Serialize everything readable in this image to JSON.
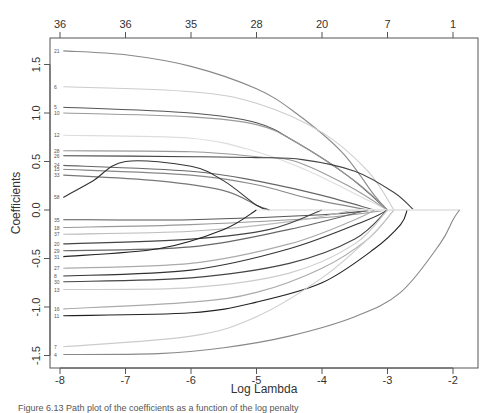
{
  "chart_data": {
    "type": "line",
    "title": "",
    "xlabel": "Log Lambda",
    "ylabel": "Coefficients",
    "xlim": [
      -8.15,
      -1.6
    ],
    "ylim": [
      -1.57,
      1.8
    ],
    "grid": false,
    "legend": "none",
    "x_ticks": [
      -8,
      -7,
      -6,
      -5,
      -4,
      -3,
      -2
    ],
    "y_ticks": [
      -1.5,
      -1.0,
      -0.5,
      0.0,
      0.5,
      1.0,
      1.5
    ],
    "y_tick_labels": [
      "-1.5",
      "-1.0",
      "-0.5",
      "0.0",
      "0.5",
      "1.0",
      "1.5"
    ],
    "top_axis": {
      "label": "number of nonzero coefficients",
      "positions": [
        -8,
        -7,
        -6,
        -5,
        -4,
        -3,
        -2
      ],
      "labels": [
        "36",
        "36",
        "35",
        "28",
        "20",
        "7",
        "1"
      ]
    },
    "series": [
      {
        "name": "21",
        "color": "#888888",
        "points": [
          [
            -7.95,
            1.64
          ],
          [
            -7,
            1.6
          ],
          [
            -6,
            1.48
          ],
          [
            -5,
            1.25
          ],
          [
            -4.4,
            1.0
          ],
          [
            -3.7,
            0.6
          ],
          [
            -3.2,
            0.15
          ],
          [
            -3.0,
            0.0
          ]
        ]
      },
      {
        "name": "6",
        "color": "#cccccc",
        "points": [
          [
            -7.95,
            1.27
          ],
          [
            -6,
            1.22
          ],
          [
            -5,
            1.1
          ],
          [
            -4,
            0.8
          ],
          [
            -3.3,
            0.4
          ],
          [
            -2.9,
            0.0
          ]
        ]
      },
      {
        "name": "5",
        "color": "#555555",
        "points": [
          [
            -7.95,
            1.06
          ],
          [
            -6,
            1.0
          ],
          [
            -5,
            0.9
          ],
          [
            -4.4,
            0.7
          ],
          [
            -3.6,
            0.35
          ],
          [
            -3.0,
            0.0
          ]
        ]
      },
      {
        "name": "10",
        "color": "#999999",
        "points": [
          [
            -7.95,
            1.0
          ],
          [
            -6,
            0.96
          ],
          [
            -5,
            0.88
          ],
          [
            -4.4,
            0.7
          ],
          [
            -3.5,
            0.3
          ],
          [
            -3.0,
            0.0
          ]
        ]
      },
      {
        "name": "12",
        "color": "#dddddd",
        "points": [
          [
            -7.95,
            0.77
          ],
          [
            -6,
            0.74
          ],
          [
            -5,
            0.6
          ],
          [
            -4.2,
            0.4
          ],
          [
            -3.3,
            0.1
          ],
          [
            -3.0,
            0.0
          ]
        ]
      },
      {
        "name": "28",
        "color": "#999999",
        "points": [
          [
            -7.95,
            0.61
          ],
          [
            -6,
            0.6
          ],
          [
            -5,
            0.55
          ],
          [
            -4.4,
            0.5
          ],
          [
            -3.6,
            0.25
          ],
          [
            -3.0,
            0.0
          ]
        ]
      },
      {
        "name": "26",
        "color": "#444444",
        "points": [
          [
            -7.95,
            0.56
          ],
          [
            -6,
            0.55
          ],
          [
            -5,
            0.54
          ],
          [
            -4.3,
            0.52
          ],
          [
            -3.5,
            0.4
          ],
          [
            -2.9,
            0.18
          ],
          [
            -2.6,
            0.0
          ]
        ]
      },
      {
        "name": "24",
        "color": "#666666",
        "points": [
          [
            -7.95,
            0.46
          ],
          [
            -6,
            0.4
          ],
          [
            -5,
            0.3
          ],
          [
            -4,
            0.15
          ],
          [
            -3.2,
            0.0
          ]
        ]
      },
      {
        "name": "15",
        "color": "#888888",
        "points": [
          [
            -7.95,
            0.42
          ],
          [
            -6,
            0.36
          ],
          [
            -5,
            0.26
          ],
          [
            -4.2,
            0.12
          ],
          [
            -3.3,
            0.0
          ]
        ]
      },
      {
        "name": "33",
        "color": "#777777",
        "points": [
          [
            -7.95,
            0.36
          ],
          [
            -6.5,
            0.3
          ],
          [
            -5.5,
            0.2
          ],
          [
            -5,
            0.05
          ],
          [
            -4.8,
            0.0
          ]
        ]
      },
      {
        "name": "58",
        "color": "#333333",
        "points": [
          [
            -7.95,
            0.13
          ],
          [
            -7.5,
            0.3
          ],
          [
            -7,
            0.5
          ],
          [
            -6,
            0.45
          ],
          [
            -5.5,
            0.3
          ],
          [
            -5,
            0.05
          ],
          [
            -4.8,
            0.0
          ]
        ]
      },
      {
        "name": "35",
        "color": "#555555",
        "points": [
          [
            -7.95,
            -0.1
          ],
          [
            -6,
            -0.1
          ],
          [
            -4,
            -0.05
          ],
          [
            -3.2,
            0.0
          ]
        ]
      },
      {
        "name": "18",
        "color": "#999999",
        "points": [
          [
            -7.95,
            -0.18
          ],
          [
            -6,
            -0.15
          ],
          [
            -4,
            -0.08
          ],
          [
            -3.0,
            0.0
          ]
        ]
      },
      {
        "name": "37",
        "color": "#bbbbbb",
        "points": [
          [
            -7.95,
            -0.25
          ],
          [
            -6,
            -0.22
          ],
          [
            -4.5,
            -0.12
          ],
          [
            -3.5,
            0.0
          ]
        ]
      },
      {
        "name": "20",
        "color": "#444444",
        "points": [
          [
            -7.95,
            -0.35
          ],
          [
            -6,
            -0.3
          ],
          [
            -4.8,
            -0.2
          ],
          [
            -4.0,
            0.0
          ]
        ]
      },
      {
        "name": "29",
        "color": "#666666",
        "points": [
          [
            -7.95,
            -0.42
          ],
          [
            -6,
            -0.38
          ],
          [
            -4.5,
            -0.2
          ],
          [
            -3.3,
            0.0
          ]
        ]
      },
      {
        "name": "31",
        "color": "#222222",
        "points": [
          [
            -7.95,
            -0.48
          ],
          [
            -6.5,
            -0.4
          ],
          [
            -5.5,
            -0.2
          ],
          [
            -5,
            0.0
          ]
        ]
      },
      {
        "name": "27",
        "color": "#aaaaaa",
        "points": [
          [
            -7.95,
            -0.6
          ],
          [
            -6,
            -0.55
          ],
          [
            -4.5,
            -0.35
          ],
          [
            -3.5,
            -0.1
          ],
          [
            -3.2,
            0.0
          ]
        ]
      },
      {
        "name": "8",
        "color": "#333333",
        "points": [
          [
            -7.95,
            -0.68
          ],
          [
            -6,
            -0.62
          ],
          [
            -4.5,
            -0.4
          ],
          [
            -3.3,
            -0.1
          ],
          [
            -3.0,
            0.0
          ]
        ]
      },
      {
        "name": "30",
        "color": "#444444",
        "points": [
          [
            -7.95,
            -0.74
          ],
          [
            -6,
            -0.7
          ],
          [
            -4.5,
            -0.55
          ],
          [
            -3.5,
            -0.3
          ],
          [
            -3.0,
            0.0
          ]
        ]
      },
      {
        "name": "13",
        "color": "#cccccc",
        "points": [
          [
            -7.95,
            -0.82
          ],
          [
            -6,
            -0.8
          ],
          [
            -4.5,
            -0.65
          ],
          [
            -3.5,
            -0.35
          ],
          [
            -3.0,
            0.0
          ]
        ]
      },
      {
        "name": "16",
        "color": "#aaaaaa",
        "points": [
          [
            -7.95,
            -1.02
          ],
          [
            -6,
            -0.95
          ],
          [
            -5,
            -0.85
          ],
          [
            -4,
            -0.6
          ],
          [
            -3.3,
            -0.3
          ],
          [
            -2.9,
            0.0
          ]
        ]
      },
      {
        "name": "11",
        "color": "#222222",
        "points": [
          [
            -7.95,
            -1.09
          ],
          [
            -6,
            -1.06
          ],
          [
            -5,
            -0.95
          ],
          [
            -4,
            -0.75
          ],
          [
            -3.2,
            -0.4
          ],
          [
            -2.8,
            -0.15
          ],
          [
            -2.7,
            0.0
          ]
        ]
      },
      {
        "name": "7",
        "color": "#cccccc",
        "points": [
          [
            -7.95,
            -1.41
          ],
          [
            -6,
            -1.3
          ],
          [
            -5,
            -1.1
          ],
          [
            -4,
            -0.7
          ],
          [
            -3.3,
            -0.3
          ],
          [
            -2.9,
            0.0
          ]
        ]
      },
      {
        "name": "4",
        "color": "#888888",
        "points": [
          [
            -7.95,
            -1.49
          ],
          [
            -6.5,
            -1.48
          ],
          [
            -5.5,
            -1.42
          ],
          [
            -4.5,
            -1.3
          ],
          [
            -3.5,
            -1.1
          ],
          [
            -2.8,
            -0.85
          ],
          [
            -2.2,
            -0.35
          ],
          [
            -2.0,
            -0.1
          ],
          [
            -1.9,
            0.0
          ]
        ]
      }
    ]
  },
  "axis_titles": {
    "x": "Log Lambda",
    "y": "Coefficients"
  },
  "caption": "Figure 6.13 Path plot of the coefficients as a function of the log penalty"
}
